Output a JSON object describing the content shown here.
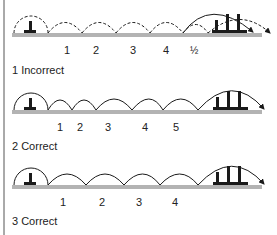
{
  "colors": {
    "ground": "#b3b3b3",
    "ink": "#1a1a1a",
    "border": "#555555"
  },
  "rows": [
    {
      "caption": "1 Incorrect",
      "style": "dashed",
      "numbers": [
        "1",
        "2",
        "3",
        "4",
        "½"
      ]
    },
    {
      "caption": "2 Correct",
      "style": "solid",
      "numbers": [
        "1",
        "2",
        "3",
        "4",
        "5"
      ]
    },
    {
      "caption": "3 Correct",
      "style": "solid",
      "numbers": [
        "1",
        "2",
        "3",
        "4"
      ]
    }
  ]
}
